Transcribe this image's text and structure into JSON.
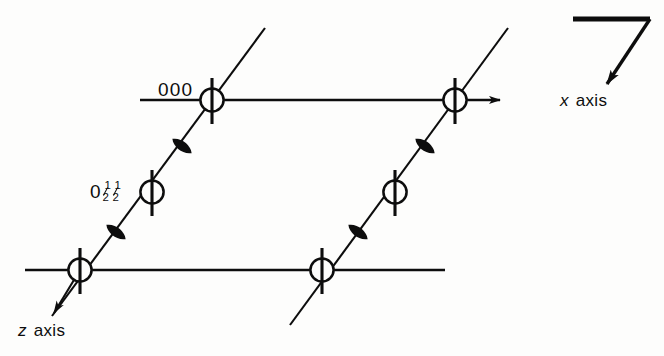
{
  "figure": {
    "kind": "space-group-symmetry-diagram",
    "background_color": "#fdfdfc",
    "ink_color": "#0d0d0d"
  },
  "labels": {
    "origin": "000",
    "half_site": {
      "leading_zero": "0",
      "fraction_one_numerator": "1",
      "fraction_one_denominator": "2",
      "fraction_two_numerator": "1",
      "fraction_two_denominator": "2",
      "plain_text": "0 1/2 1/2"
    },
    "x_axis": {
      "symbol": "x",
      "word": "axis"
    },
    "z_axis": {
      "symbol": "z",
      "word": "axis"
    }
  },
  "nodes": [
    {
      "name": "node-origin-000",
      "x": 212,
      "y": 100,
      "label": "000"
    },
    {
      "name": "node-top-right",
      "x": 455,
      "y": 100,
      "label": ""
    },
    {
      "name": "node-mid-left-half",
      "x": 152,
      "y": 192,
      "label": "0 1/2 1/2"
    },
    {
      "name": "node-mid-right",
      "x": 395,
      "y": 192,
      "label": ""
    },
    {
      "name": "node-bottom-left",
      "x": 80,
      "y": 270,
      "label": ""
    },
    {
      "name": "node-bottom-right",
      "x": 322,
      "y": 270,
      "label": ""
    }
  ],
  "lens_markers": [
    {
      "name": "lens-upper-left",
      "x": 182,
      "y": 146
    },
    {
      "name": "lens-lower-left",
      "x": 116,
      "y": 232
    },
    {
      "name": "lens-upper-right",
      "x": 425,
      "y": 146
    },
    {
      "name": "lens-lower-right",
      "x": 358,
      "y": 232
    }
  ],
  "axis_lines": {
    "top_horizontal": {
      "x1": 140,
      "y1": 100,
      "x2": 500,
      "y2": 100
    },
    "bottom_horizontal": {
      "x1": 25,
      "y1": 270,
      "x2": 445,
      "y2": 270
    },
    "x_arrow": {
      "x1": 500,
      "y1": 100,
      "x2": 548,
      "y2": 100
    },
    "z_arrow": {
      "x1": 80,
      "y1": 270,
      "x2": 52,
      "y2": 316
    }
  },
  "corner_marker": {
    "name": "y-axis-corner-arrow",
    "horizontal": {
      "x1": 573,
      "y1": 19,
      "x2": 650,
      "y2": 19
    },
    "diagonal": {
      "x1": 650,
      "y1": 19,
      "x2": 604,
      "y2": 88
    }
  }
}
